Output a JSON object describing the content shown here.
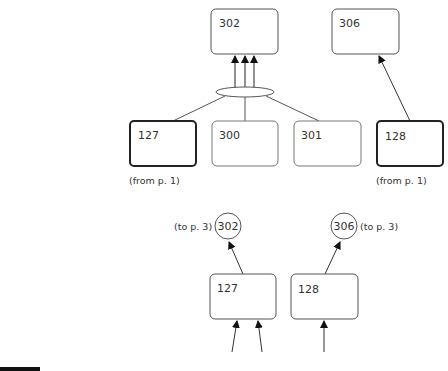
{
  "upper_diagram": {
    "targets": [
      {
        "id": "box-302",
        "label": "302"
      },
      {
        "id": "box-306",
        "label": "306"
      }
    ],
    "sources": [
      {
        "id": "box-127",
        "label": "127",
        "thick": true,
        "note": "(from p. 1)"
      },
      {
        "id": "box-300",
        "label": "300",
        "thick": false
      },
      {
        "id": "box-301",
        "label": "301",
        "thick": false
      },
      {
        "id": "box-128",
        "label": "128",
        "thick": true,
        "note": "(from p. 1)"
      }
    ]
  },
  "lower_diagram": {
    "connectors": [
      {
        "label": "302",
        "note": "(to p. 3)"
      },
      {
        "label": "306",
        "note": "(to p. 3)"
      }
    ],
    "boxes": [
      {
        "label": "127"
      },
      {
        "label": "128"
      }
    ]
  },
  "colors": {
    "stroke": "#555555",
    "thick_stroke": "#222222",
    "text": "#333333"
  }
}
